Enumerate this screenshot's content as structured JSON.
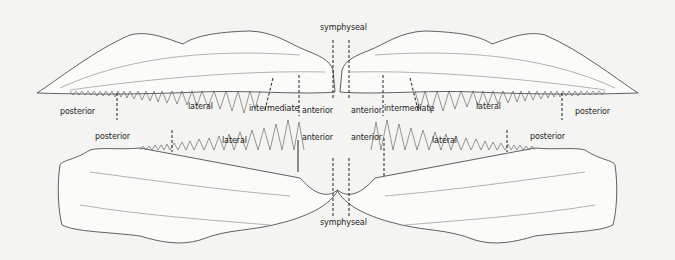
{
  "diagram": {
    "upper_jaw": {
      "labels": {
        "symphyseal": "symphyseal",
        "left_posterior": "posterior",
        "left_lateral": "lateral",
        "left_intermediate": "intermediate",
        "left_anterior": "anterior",
        "right_anterior": "anterior",
        "right_intermediate": "intermediate",
        "right_lateral": "lateral",
        "right_posterior": "posterior"
      }
    },
    "lower_jaw": {
      "labels": {
        "left_posterior": "posterior",
        "left_lateral": "lateral",
        "left_anterior": "anterior",
        "right_anterior": "anterior",
        "right_lateral": "lateral",
        "right_posterior": "posterior",
        "symphyseal": "symphyseal"
      }
    },
    "colors": {
      "background": "#f4f4f2",
      "outline": "#3a3a3a",
      "jaw_fill": "#fbfbfa",
      "label_text": "#1c1c1c"
    }
  }
}
